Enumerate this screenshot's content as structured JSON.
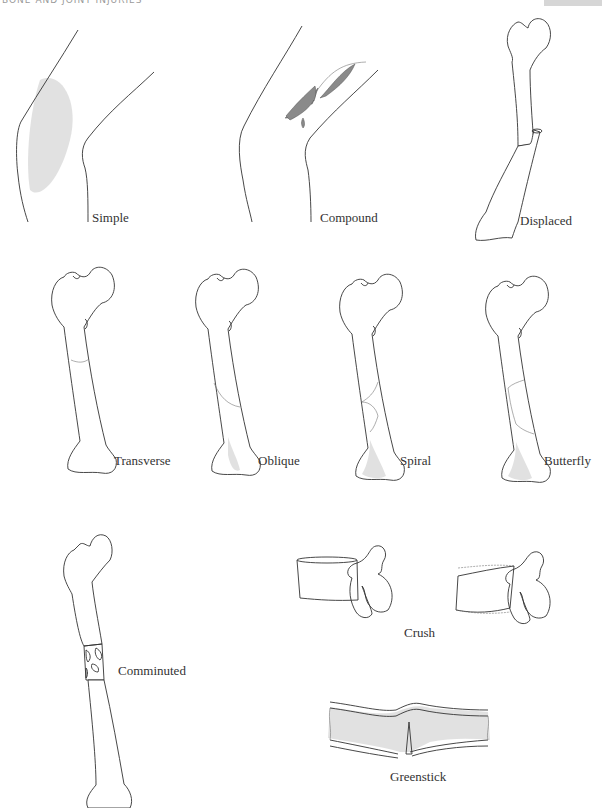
{
  "page": {
    "header": "BONE AND JOINT INJURIES"
  },
  "figures": [
    {
      "id": "simple",
      "label": "Simple"
    },
    {
      "id": "compound",
      "label": "Compound"
    },
    {
      "id": "displaced",
      "label": "Displaced"
    },
    {
      "id": "transverse",
      "label": "Transverse"
    },
    {
      "id": "oblique",
      "label": "Oblique"
    },
    {
      "id": "spiral",
      "label": "Spiral"
    },
    {
      "id": "butterfly",
      "label": "Butterfly"
    },
    {
      "id": "comminuted",
      "label": "Comminuted"
    },
    {
      "id": "crush",
      "label": "Crush"
    },
    {
      "id": "greenstick",
      "label": "Greenstick"
    }
  ],
  "colors": {
    "line": "#333333",
    "shading": "#d9d9d9",
    "wound": "#8a8a8a",
    "header_tab": "#d6d6d6"
  }
}
